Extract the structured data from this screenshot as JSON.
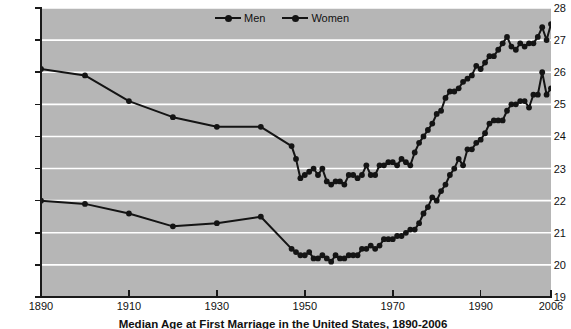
{
  "chart_data": {
    "type": "line",
    "title": "",
    "caption": "Median Age at First Marriage in the United States, 1890-2006",
    "xlabel": "",
    "ylabel": "Age in Years",
    "xlim": [
      1890,
      2006
    ],
    "ylim": [
      19,
      28
    ],
    "yticks": [
      19,
      20,
      21,
      22,
      23,
      24,
      25,
      26,
      27,
      28
    ],
    "xticks": [
      1890,
      1910,
      1930,
      1950,
      1970,
      1990,
      2006
    ],
    "grid": "horizontal",
    "legend_position": "top-center",
    "plot_background": "#b6b6b6",
    "gridline_color": "#ffffff",
    "line_color": "#141414",
    "series": [
      {
        "name": "Men",
        "x": [
          1890,
          1900,
          1910,
          1920,
          1930,
          1940,
          1947,
          1948,
          1949,
          1950,
          1951,
          1952,
          1953,
          1954,
          1955,
          1956,
          1957,
          1958,
          1959,
          1960,
          1961,
          1962,
          1963,
          1964,
          1965,
          1966,
          1967,
          1968,
          1969,
          1970,
          1971,
          1972,
          1973,
          1974,
          1975,
          1976,
          1977,
          1978,
          1979,
          1980,
          1981,
          1982,
          1983,
          1984,
          1985,
          1986,
          1987,
          1988,
          1989,
          1990,
          1991,
          1992,
          1993,
          1994,
          1995,
          1996,
          1997,
          1998,
          1999,
          2000,
          2001,
          2002,
          2003,
          2004,
          2005,
          2006
        ],
        "values": [
          26.1,
          25.9,
          25.1,
          24.6,
          24.3,
          24.3,
          23.7,
          23.3,
          22.7,
          22.8,
          22.9,
          23.0,
          22.8,
          23.0,
          22.6,
          22.5,
          22.6,
          22.6,
          22.5,
          22.8,
          22.8,
          22.7,
          22.8,
          23.1,
          22.8,
          22.8,
          23.1,
          23.1,
          23.2,
          23.2,
          23.1,
          23.3,
          23.2,
          23.1,
          23.5,
          23.8,
          24.0,
          24.2,
          24.4,
          24.7,
          24.8,
          25.2,
          25.4,
          25.4,
          25.5,
          25.7,
          25.8,
          25.9,
          26.2,
          26.1,
          26.3,
          26.5,
          26.5,
          26.7,
          26.9,
          27.1,
          26.8,
          26.7,
          26.9,
          26.8,
          26.9,
          26.9,
          27.1,
          27.4,
          27.0,
          27.5
        ],
        "marker": "circle"
      },
      {
        "name": "Women",
        "x": [
          1890,
          1900,
          1910,
          1920,
          1930,
          1940,
          1947,
          1948,
          1949,
          1950,
          1951,
          1952,
          1953,
          1954,
          1955,
          1956,
          1957,
          1958,
          1959,
          1960,
          1961,
          1962,
          1963,
          1964,
          1965,
          1966,
          1967,
          1968,
          1969,
          1970,
          1971,
          1972,
          1973,
          1974,
          1975,
          1976,
          1977,
          1978,
          1979,
          1980,
          1981,
          1982,
          1983,
          1984,
          1985,
          1986,
          1987,
          1988,
          1989,
          1990,
          1991,
          1992,
          1993,
          1994,
          1995,
          1996,
          1997,
          1998,
          1999,
          2000,
          2001,
          2002,
          2003,
          2004,
          2005,
          2006
        ],
        "values": [
          22.0,
          21.9,
          21.6,
          21.2,
          21.3,
          21.5,
          20.5,
          20.4,
          20.3,
          20.3,
          20.4,
          20.2,
          20.2,
          20.3,
          20.2,
          20.1,
          20.3,
          20.2,
          20.2,
          20.3,
          20.3,
          20.3,
          20.5,
          20.5,
          20.6,
          20.5,
          20.6,
          20.8,
          20.8,
          20.8,
          20.9,
          20.9,
          21.0,
          21.1,
          21.1,
          21.3,
          21.6,
          21.8,
          22.1,
          22.0,
          22.3,
          22.5,
          22.8,
          23.0,
          23.3,
          23.1,
          23.6,
          23.6,
          23.8,
          23.9,
          24.1,
          24.4,
          24.5,
          24.5,
          24.5,
          24.8,
          25.0,
          25.0,
          25.1,
          25.1,
          24.9,
          25.3,
          25.3,
          26.0,
          25.3,
          25.5
        ],
        "marker": "circle"
      }
    ]
  },
  "axis": {
    "y_title": "Age in Years",
    "y_tick_labels": [
      "28",
      "27",
      "26",
      "25",
      "24",
      "23",
      "22",
      "21",
      "20",
      "19"
    ],
    "x_tick_labels": [
      "1890",
      "1910",
      "1930",
      "1950",
      "1970",
      "1990",
      "2006"
    ]
  },
  "legend": {
    "items": [
      {
        "label": "Men"
      },
      {
        "label": "Women"
      }
    ]
  },
  "caption": {
    "text": "Median Age at First Marriage in the United States, 1890-2006"
  }
}
